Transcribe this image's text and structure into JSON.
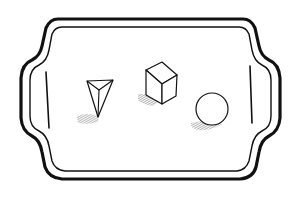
{
  "illustration": {
    "subject": "tray with three geometric solids",
    "background_color": "#ffffff",
    "ink_color": "#111111",
    "shadow_color": "#555555",
    "objects": [
      {
        "name": "triangular-pyramid",
        "label": "pyramid"
      },
      {
        "name": "cube",
        "label": "cube"
      },
      {
        "name": "sphere",
        "label": "sphere"
      }
    ]
  }
}
